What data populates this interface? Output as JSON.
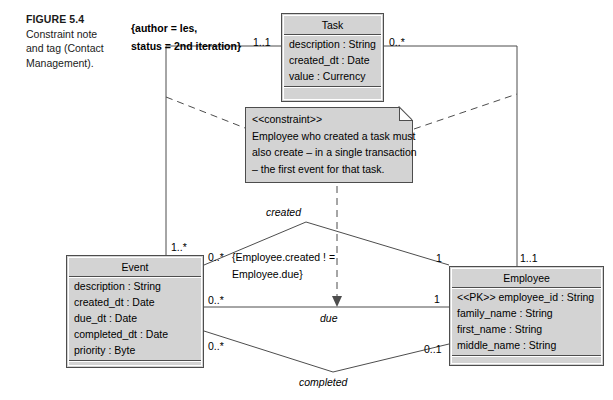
{
  "figure": {
    "title": "FIGURE 5.4",
    "body_line1": "Constraint note",
    "body_line2": "and tag (Contact",
    "body_line3": "Management)."
  },
  "tag_note": {
    "line1": "{author = les,",
    "line2": "status = 2nd iteration}"
  },
  "classes": {
    "task": {
      "name": "Task",
      "attributes": [
        "description : String",
        "created_dt : Date",
        "value : Currency"
      ],
      "operations": []
    },
    "event": {
      "name": "Event",
      "attributes": [
        "description : String",
        "created_dt : Date",
        "due_dt : Date",
        "completed_dt : Date",
        "priority : Byte"
      ],
      "operations": []
    },
    "employee": {
      "name": "Employee",
      "attributes": [
        "<<PK>> employee_id : String",
        "family_name : String",
        "first_name : String",
        "middle_name : String"
      ],
      "operations": []
    }
  },
  "constraint_note": {
    "stereotype": "<<constraint>>",
    "line1": "Employee who created a task must",
    "line2": "also create – in a single transaction",
    "line3": "– the first event for that task."
  },
  "inline_constraint": {
    "line1": "{Employee.created ! =",
    "line2": "Employee.due}"
  },
  "associations": {
    "created_label": "created",
    "due_label": "due",
    "completed_label": "completed"
  },
  "multiplicities": {
    "task_left": "1..1",
    "task_right": "0..*",
    "event_top": "1..*",
    "event_created": "0..*",
    "event_due": "0..*",
    "event_completed": "0..*",
    "employee_top": "1..1",
    "employee_created": "1",
    "employee_due": "1",
    "employee_completed": "0..1"
  },
  "colors": {
    "box_fill": "#d3d3d3",
    "box_stroke": "#4d4d4d",
    "line": "#4d4d4d",
    "background": "#ffffff"
  }
}
